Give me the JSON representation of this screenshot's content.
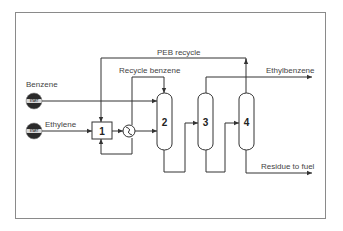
{
  "diagram": {
    "type": "process-flow",
    "feeds": [
      {
        "label": "Benzene",
        "button_text": "START"
      },
      {
        "label": "Ethylene",
        "button_text": "START"
      }
    ],
    "units": [
      {
        "id": "1",
        "label": "1",
        "kind": "reactor-box"
      },
      {
        "id": "hx",
        "label": "",
        "kind": "heat-exchanger"
      },
      {
        "id": "2",
        "label": "2",
        "kind": "column"
      },
      {
        "id": "3",
        "label": "3",
        "kind": "column"
      },
      {
        "id": "4",
        "label": "4",
        "kind": "column"
      }
    ],
    "streams": {
      "peb_recycle": "PEB recycle",
      "recycle_benzene": "Recycle benzene",
      "ethylbenzene": "Ethylbenzene",
      "residue": "Residue to fuel"
    },
    "colors": {
      "line": "#333333",
      "frame": "#8a8a8a",
      "button_dark": "#2a2a2a",
      "button_band": "#d8d8d8"
    }
  }
}
